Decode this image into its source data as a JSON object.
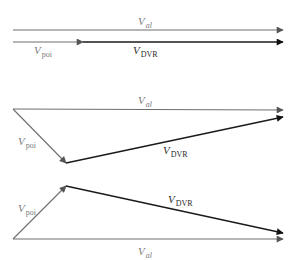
{
  "colors": {
    "background": "#ffffff",
    "v_al": "#6e6e6e",
    "v_poi": "#6e6e6e",
    "v_dvr": "#1a1a1a",
    "label_gray": "#7a7a7a",
    "label_dark": "#2a2a2a"
  },
  "labels": {
    "v_main": "V",
    "sub_al": "al",
    "sub_poi": "poi",
    "sub_dvr": "DVR"
  },
  "diagrams": [
    {
      "name": "in-phase",
      "vectors": {
        "v_al": {
          "from": [
            13,
            30
          ],
          "to": [
            283,
            30
          ]
        },
        "v_poi": {
          "from": [
            13,
            42
          ],
          "to": [
            83,
            42
          ]
        },
        "v_dvr": {
          "from": [
            83,
            42
          ],
          "to": [
            283,
            42
          ]
        }
      },
      "label_positions": {
        "v_al": [
          138,
          25
        ],
        "v_poi": [
          34,
          54
        ],
        "v_dvr": [
          133,
          54
        ]
      }
    },
    {
      "name": "lagging",
      "vectors": {
        "v_al": {
          "from": [
            13,
            109
          ],
          "to": [
            283,
            110
          ]
        },
        "v_poi": {
          "from": [
            13,
            109
          ],
          "to": [
            66,
            163
          ]
        },
        "v_dvr": {
          "from": [
            66,
            163
          ],
          "to": [
            283,
            117
          ]
        }
      },
      "label_positions": {
        "v_al": [
          138,
          104
        ],
        "v_poi": [
          18,
          145
        ],
        "v_dvr": [
          163,
          154
        ]
      }
    },
    {
      "name": "leading",
      "vectors": {
        "v_poi": {
          "from": [
            13,
            239
          ],
          "to": [
            66,
            186
          ]
        },
        "v_dvr": {
          "from": [
            66,
            186
          ],
          "to": [
            283,
            233
          ]
        },
        "v_al": {
          "from": [
            13,
            239
          ],
          "to": [
            283,
            239
          ]
        }
      },
      "label_positions": {
        "v_poi": [
          18,
          212
        ],
        "v_dvr": [
          168,
          203
        ],
        "v_al": [
          138,
          255
        ]
      }
    }
  ]
}
